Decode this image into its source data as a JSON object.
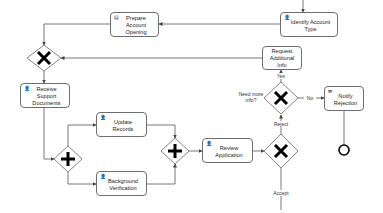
{
  "tasks": {
    "identify_account_type": {
      "label": "Identify Account Type",
      "icon": "user-task"
    },
    "prepare_account_opening": {
      "label": "Prepare Account Opening",
      "icon": "script-task"
    },
    "request_additional_info": {
      "label": "Request Additional Info",
      "icon": "none"
    },
    "receive_support_documents": {
      "label": "Receive Support Documents",
      "icon": "user-task"
    },
    "update_records": {
      "label": "Update Records",
      "icon": "user-task"
    },
    "background_verification": {
      "label": "Background Verification",
      "icon": "user-task"
    },
    "review_application": {
      "label": "Review Application",
      "icon": "user-task"
    },
    "notify_rejection": {
      "label": "Notify Rejection",
      "icon": "send-task"
    }
  },
  "gateways": {
    "merge_xor": {
      "type": "exclusive"
    },
    "need_more_info": {
      "type": "exclusive",
      "label": "Need more info?"
    },
    "review_decision": {
      "type": "exclusive"
    },
    "fork_parallel": {
      "type": "parallel"
    },
    "join_parallel": {
      "type": "parallel"
    }
  },
  "flow_labels": {
    "yes": "Yes",
    "no": "No",
    "reject": "Reject",
    "accept": "Accept"
  },
  "icons": {
    "user_task": "👤",
    "script_task": "▤",
    "send_task": "✉"
  }
}
